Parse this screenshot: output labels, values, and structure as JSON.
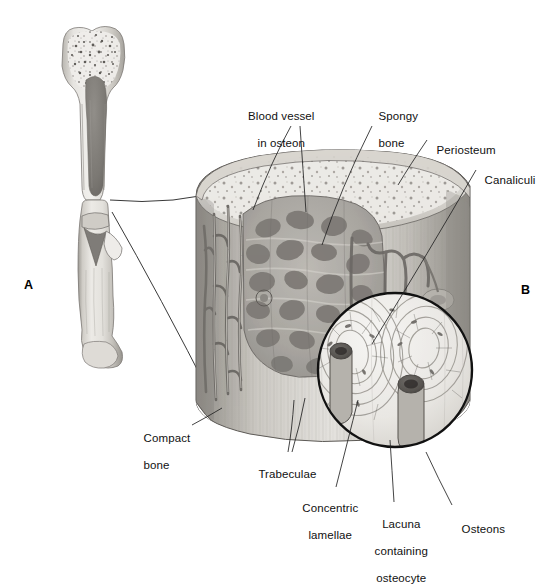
{
  "figure": {
    "type": "anatomical-illustration",
    "style": "grayscale pencil/airbrush medical illustration",
    "background_color": "#ffffff",
    "ink_color": "#111111",
    "bone_light": "#e8e6e2",
    "bone_mid": "#c3c0ba",
    "bone_dark": "#8d8a85",
    "cavity_dark": "#6f6c68"
  },
  "panels": [
    {
      "id": "A",
      "label": "A",
      "x": 24,
      "y": 278,
      "description": "gross long bone, longitudinal section and diaphysis wedge"
    },
    {
      "id": "B",
      "label": "B",
      "x": 521,
      "y": 283,
      "description": "magnified cut cylinder of bone shaft"
    }
  ],
  "labels": [
    {
      "name": "blood-vessel-in-osteon",
      "lines": [
        "Blood vessel",
        "in osteon"
      ],
      "text": "Blood vessel in osteon",
      "x": 255,
      "y": 97,
      "align": "center",
      "leaders": [
        [
          [
            291,
            126
          ],
          [
            272,
            160
          ],
          [
            253,
            210
          ]
        ],
        [
          [
            300,
            126
          ],
          [
            303,
            170
          ],
          [
            306,
            212
          ]
        ]
      ]
    },
    {
      "name": "spongy-bone",
      "lines": [
        "Spongy",
        "bone"
      ],
      "text": "Spongy bone",
      "x": 372,
      "y": 97,
      "align": "left",
      "leaders": [
        [
          [
            372,
            126
          ],
          [
            340,
            190
          ],
          [
            322,
            245
          ]
        ]
      ]
    },
    {
      "name": "periosteum",
      "lines": [
        "Periosteum"
      ],
      "text": "Periosteum",
      "x": 430,
      "y": 131,
      "align": "left",
      "leaders": [
        [
          [
            427,
            140
          ],
          [
            410,
            165
          ],
          [
            398,
            185
          ]
        ]
      ]
    },
    {
      "name": "canaliculi",
      "lines": [
        "Canaliculi"
      ],
      "text": "Canaliculi",
      "x": 478,
      "y": 161,
      "align": "left",
      "leaders": [
        [
          [
            476,
            170
          ],
          [
            430,
            250
          ],
          [
            372,
            344
          ]
        ]
      ]
    },
    {
      "name": "compact-bone",
      "lines": [
        "Compact",
        "bone"
      ],
      "text": "Compact bone",
      "x": 137,
      "y": 419,
      "align": "left",
      "leaders": [
        [
          [
            192,
            425
          ],
          [
            207,
            417
          ],
          [
            222,
            408
          ]
        ]
      ]
    },
    {
      "name": "trabeculae",
      "lines": [
        "Trabeculae"
      ],
      "text": "Trabeculae",
      "x": 252,
      "y": 455,
      "align": "left",
      "leaders": [
        [
          [
            288,
            452
          ],
          [
            292,
            430
          ],
          [
            294,
            400
          ]
        ],
        [
          [
            292,
            452
          ],
          [
            300,
            425
          ],
          [
            305,
            398
          ]
        ]
      ]
    },
    {
      "name": "concentric-lamellae",
      "lines": [
        "Concentric",
        "lamellae"
      ],
      "text": "Concentric lamellae",
      "x": 296,
      "y": 489,
      "align": "center",
      "leaders": [
        [
          [
            336,
            487
          ],
          [
            348,
            440
          ],
          [
            358,
            400
          ]
        ]
      ]
    },
    {
      "name": "lacuna-containing-osteocyte",
      "lines": [
        "Lacuna",
        "containing",
        "osteocyte"
      ],
      "text": "Lacuna containing osteocyte",
      "x": 375,
      "y": 505,
      "align": "center",
      "leaders": [
        [
          [
            394,
            502
          ],
          [
            392,
            470
          ],
          [
            390,
            440
          ]
        ]
      ]
    },
    {
      "name": "osteons",
      "lines": [
        "Osteons"
      ],
      "text": "Osteons",
      "x": 455,
      "y": 510,
      "align": "left",
      "leaders": [
        [
          [
            452,
            505
          ],
          [
            438,
            478
          ],
          [
            426,
            452
          ]
        ]
      ]
    }
  ],
  "connector_lines": [
    {
      "name": "epiphysis-to-cylinder-connector",
      "path": [
        [
          110,
          200
        ],
        [
          175,
          204
        ],
        [
          230,
          190
        ]
      ]
    },
    {
      "name": "diaphysis-to-cylinder-connector",
      "path": [
        [
          110,
          212
        ],
        [
          165,
          300
        ],
        [
          215,
          400
        ]
      ]
    }
  ],
  "structures": {
    "gross_bone_upper": {
      "name": "proximal-long-bone-section",
      "features": [
        "epiphysis",
        "spongy bone trabeculae",
        "compact bone cortex",
        "medullary cavity"
      ]
    },
    "gross_bone_lower": {
      "name": "diaphysis-wedge-section",
      "features": [
        "diaphysis",
        "wedge cut",
        "distal end"
      ]
    },
    "cylinder": {
      "name": "magnified-bone-cylinder",
      "features": [
        "periosteum",
        "compact bone",
        "spongy bone",
        "trabeculae",
        "blood vessels",
        "osteons"
      ]
    },
    "magnifier": {
      "name": "osteon-magnification-circle",
      "center_x": 395,
      "center_y": 370,
      "radius": 78,
      "features": [
        "concentric lamellae",
        "central canals",
        "canaliculi",
        "lacunae"
      ]
    }
  }
}
